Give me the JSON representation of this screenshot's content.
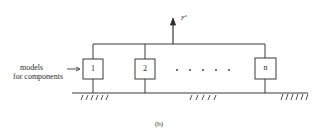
{
  "diagram": {
    "force_label": "F",
    "force_superscript": "a",
    "side_label_line1": "models",
    "side_label_line2": "for components",
    "components": [
      {
        "label": "1"
      },
      {
        "label": "2"
      },
      {
        "label": "n"
      }
    ],
    "ellipsis": "· · · · · ·",
    "caption": "(b)",
    "colors": {
      "line": "#3a3a3a",
      "background": "#ffffff"
    }
  }
}
